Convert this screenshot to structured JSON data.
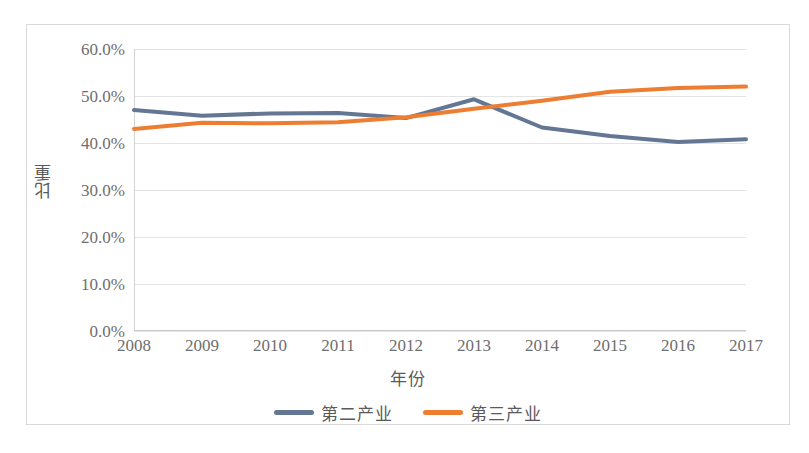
{
  "chart_data": {
    "type": "line",
    "title": "",
    "xlabel": "年份",
    "ylabel": "比重",
    "categories": [
      "2008",
      "2009",
      "2010",
      "2011",
      "2012",
      "2013",
      "2014",
      "2015",
      "2016",
      "2017"
    ],
    "x": [
      2008,
      2009,
      2010,
      2011,
      2012,
      2013,
      2014,
      2015,
      2016,
      2017
    ],
    "series": [
      {
        "name": "第二产业",
        "color": "#637693",
        "values": [
          47.0,
          45.8,
          46.3,
          46.4,
          45.3,
          49.3,
          43.3,
          41.5,
          40.2,
          40.8
        ]
      },
      {
        "name": "第三产业",
        "color": "#ed7d31",
        "values": [
          43.0,
          44.3,
          44.2,
          44.4,
          45.5,
          47.3,
          49.0,
          50.9,
          51.7,
          52.0
        ]
      }
    ],
    "ylim": [
      0,
      60
    ],
    "ytick_values": [
      0,
      10,
      20,
      30,
      40,
      50,
      60
    ],
    "ytick_labels": [
      "0.0%",
      "10.0%",
      "20.0%",
      "30.0%",
      "40.0%",
      "50.0%",
      "60.0%"
    ],
    "grid": true,
    "legend_position": "bottom"
  },
  "legend": {
    "items": [
      {
        "label": "第二产业",
        "color": "#637693"
      },
      {
        "label": "第三产业",
        "color": "#ed7d31"
      }
    ]
  }
}
